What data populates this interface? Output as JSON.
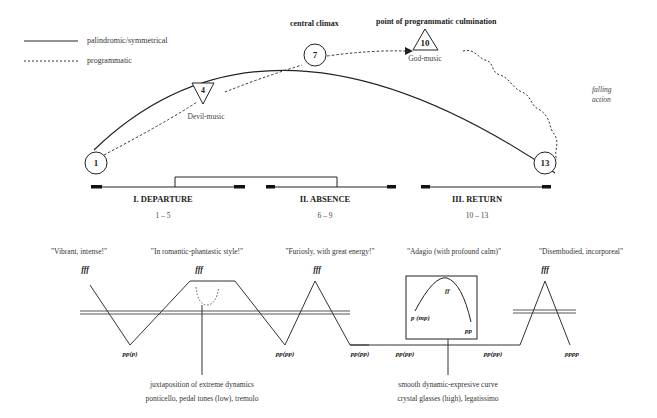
{
  "legend": {
    "solid_label": "palindromic/symmetrical",
    "dotted_label": "programmatic"
  },
  "headings": {
    "central_climax": "central climax",
    "programmatic_culmination": "point of programmatic culmination",
    "falling_action_line1": "falling",
    "falling_action_line2": "action"
  },
  "nodes": {
    "n1": "1",
    "n4": "4",
    "n7": "7",
    "n10": "10",
    "n13": "13",
    "n4_caption": "Devil-music",
    "n10_caption": "God-music"
  },
  "sections": [
    {
      "title": "I. DEPARTURE",
      "range": "1 – 5"
    },
    {
      "title": "II. ABSENCE",
      "range": "6 – 9"
    },
    {
      "title": "III. RETURN",
      "range": "10 – 13"
    }
  ],
  "quotes": [
    "\"Vibrant, intense!\"",
    "\"In romantic-phantastic style!\"",
    "\"Furiosly, with great energy!\"",
    "\"Adagio (with profound calm)\"",
    "\"Disembodied, incorporeal\""
  ],
  "dynamics": {
    "fff_1": "fff",
    "fff_2": "fff",
    "fff_3": "fff",
    "fff_4": "fff",
    "low_1": "pp(p)",
    "low_2": "pp(pp)",
    "low_3": "pp(pp)",
    "low_4": "pp(pp)",
    "low_5": "pp(pp)",
    "low_6": "pppp",
    "adagio_start": "p (mp)",
    "adagio_peak": "ff",
    "adagio_end": "pp"
  },
  "notes": {
    "left_line1": "juxtaposition of extreme dynamics",
    "left_line2": "ponticello, pedal tones (low), tremolo",
    "right_line1": "smooth dynamic-expresive curve",
    "right_line2": "crystal glasses (high), legatissimo"
  }
}
